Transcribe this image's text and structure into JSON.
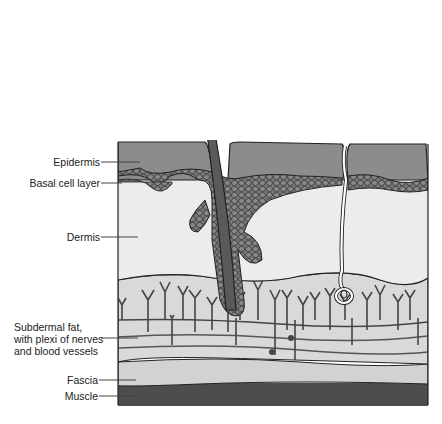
{
  "colors": {
    "epidermis": "#8c8c8c",
    "basal": "#6e6e6e",
    "dermis": "#ececec",
    "subdermal": "#d8d8d8",
    "fascia": "#cfcfcf",
    "muscle": "#4d4d4d",
    "outline": "#222222",
    "hair": "#5a5a5a",
    "vessel": "#555555"
  },
  "labels": [
    {
      "id": "epidermis",
      "text": "Epidermis"
    },
    {
      "id": "basal",
      "text": "Basal cell layer"
    },
    {
      "id": "dermis",
      "text": "Dermis"
    },
    {
      "id": "subdermal",
      "lines": [
        "Subdermal fat,",
        "with plexi of nerves",
        "and blood vessels"
      ]
    },
    {
      "id": "fascia",
      "text": "Fascia"
    },
    {
      "id": "muscle",
      "text": "Muscle"
    }
  ]
}
